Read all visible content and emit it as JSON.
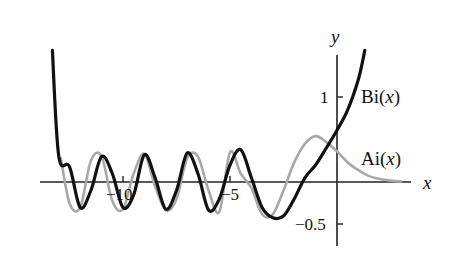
{
  "chart_data": {
    "type": "line",
    "title": "",
    "xlabel": "x",
    "ylabel": "y",
    "xlim": [
      -13.6,
      3.4
    ],
    "ylim": [
      -0.75,
      1.55
    ],
    "grid": false,
    "legend_position": "inline labels at right",
    "x_ticks": [
      {
        "value": -10,
        "label": "−10"
      },
      {
        "value": -5,
        "label": "−5"
      }
    ],
    "y_ticks": [
      {
        "value": 1,
        "label": "1"
      },
      {
        "value": -0.5,
        "label": "−0.5"
      }
    ],
    "series": [
      {
        "name": "Bi(x)",
        "label": "Bi(x)",
        "style": "thick black solid",
        "color": "#111111",
        "x": [
          -13.3,
          -13.0,
          -12.5,
          -12.0,
          -11.5,
          -11.0,
          -10.5,
          -10.0,
          -9.5,
          -9.0,
          -8.5,
          -8.0,
          -7.5,
          -7.0,
          -6.5,
          -6.0,
          -5.5,
          -5.0,
          -4.5,
          -4.0,
          -3.5,
          -3.0,
          -2.5,
          -2.0,
          -1.5,
          -1.0,
          -0.5,
          0.0,
          0.5,
          1.0,
          1.3
        ],
        "values": [
          1.55,
          0.3,
          0.18,
          -0.3,
          -0.1,
          0.3,
          0.1,
          -0.3,
          -0.15,
          0.32,
          0.05,
          -0.32,
          -0.1,
          0.34,
          0.1,
          -0.33,
          -0.2,
          0.2,
          0.38,
          0.05,
          -0.3,
          -0.42,
          -0.4,
          -0.2,
          0.05,
          0.2,
          0.4,
          0.61,
          0.85,
          1.21,
          1.55
        ]
      },
      {
        "name": "Ai(x)",
        "label": "Ai(x)",
        "style": "gray solid",
        "color": "#a8a8a8",
        "x": [
          -12.9,
          -12.5,
          -12.0,
          -11.5,
          -11.0,
          -10.5,
          -10.0,
          -9.5,
          -9.0,
          -8.5,
          -8.0,
          -7.5,
          -7.0,
          -6.5,
          -6.0,
          -5.5,
          -5.0,
          -4.5,
          -4.0,
          -3.5,
          -3.0,
          -2.5,
          -2.0,
          -1.5,
          -1.0,
          -0.5,
          0.0,
          0.5,
          1.0,
          1.5,
          2.0,
          2.5,
          3.0
        ],
        "values": [
          0.28,
          -0.25,
          -0.3,
          0.25,
          0.3,
          -0.22,
          -0.32,
          0.1,
          0.33,
          -0.05,
          -0.33,
          -0.2,
          0.28,
          0.3,
          -0.1,
          -0.35,
          0.35,
          0.1,
          -0.07,
          -0.38,
          -0.38,
          -0.1,
          0.23,
          0.45,
          0.54,
          0.47,
          0.36,
          0.23,
          0.14,
          0.07,
          0.035,
          0.016,
          0.007
        ]
      }
    ],
    "annotations": [
      {
        "text": "Bi(x)",
        "x": 0.6,
        "y": 1.0
      },
      {
        "text": "Ai(x)",
        "x": 0.6,
        "y": 0.35
      }
    ]
  },
  "labels": {
    "x_axis": "x",
    "y_axis": "y",
    "tick_x_m10": "−10",
    "tick_x_m5": "−5",
    "tick_y_1": "1",
    "tick_y_m05": "−0.5",
    "bi_prefix": "Bi(",
    "ai_prefix": "Ai(",
    "var": "x",
    "close": ")"
  }
}
